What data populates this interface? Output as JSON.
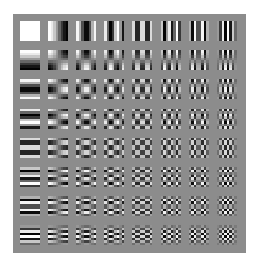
{
  "figure": {
    "grid_rows": 8,
    "grid_cols": 8,
    "block_size": 8,
    "background_color": "#8c8c8c",
    "panel": {
      "left": 13,
      "top": 14,
      "width": 233,
      "height": 239
    },
    "tile": {
      "first_x": 20,
      "first_y": 21,
      "size": 20,
      "step_x": 28.1,
      "step_y": 29.2
    }
  }
}
